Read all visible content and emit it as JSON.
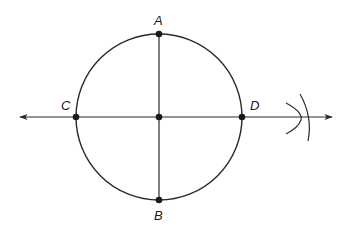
{
  "diagram": {
    "type": "geometric-construction",
    "colors": {
      "stroke": "#2a2a2a",
      "background": "#ffffff"
    },
    "circle": {
      "cx": 159,
      "cy": 117,
      "r": 83
    },
    "points": [
      {
        "name": "A",
        "x": 159,
        "y": 34
      },
      {
        "name": "B",
        "x": 159,
        "y": 200
      },
      {
        "name": "C",
        "x": 76,
        "y": 117
      },
      {
        "name": "D",
        "x": 242,
        "y": 117
      },
      {
        "name": "center",
        "x": 159,
        "y": 117
      }
    ],
    "labels": {
      "A": "A",
      "B": "B",
      "C": "C",
      "D": "D"
    },
    "line": {
      "x1": 18,
      "y1": 117,
      "x2": 333,
      "y2": 117,
      "arrows": "both"
    },
    "segment": {
      "from": "A",
      "to": "B"
    },
    "arcs": [
      {
        "description": "arc crossing line near x=301 curving right"
      },
      {
        "description": "arc crossing line near x=301 curving left"
      }
    ]
  }
}
